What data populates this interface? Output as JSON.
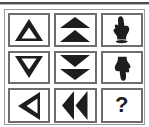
{
  "window": {
    "title": "Navigation Buttons Palette"
  },
  "separator": {
    "name": "top-divider"
  },
  "panel": {
    "name": "button-grid-panel",
    "columns": 3,
    "rows": 3
  },
  "buttons": [
    {
      "id": "step-up",
      "label": "Step Up",
      "icon": "hollow-triangle-up-icon",
      "aria": "Move up one step",
      "row": 1,
      "col": 1
    },
    {
      "id": "jump-up",
      "label": "Jump Up",
      "icon": "double-triangle-up-icon",
      "aria": "Move up quickly",
      "row": 1,
      "col": 2
    },
    {
      "id": "point-up",
      "label": "Point Up",
      "icon": "hand-pointing-up-icon",
      "aria": "Hand pointing up",
      "row": 1,
      "col": 3
    },
    {
      "id": "step-down",
      "label": "Step Down",
      "icon": "hollow-triangle-down-icon",
      "aria": "Move down one step",
      "row": 2,
      "col": 1
    },
    {
      "id": "jump-down",
      "label": "Jump Down",
      "icon": "double-triangle-down-icon",
      "aria": "Move down quickly",
      "row": 2,
      "col": 2
    },
    {
      "id": "point-down",
      "label": "Point Down",
      "icon": "hand-pointing-down-icon",
      "aria": "Hand pointing down",
      "row": 2,
      "col": 3
    },
    {
      "id": "step-left",
      "label": "Step Left",
      "icon": "hollow-triangle-left-icon",
      "aria": "Move left one step",
      "row": 3,
      "col": 1
    },
    {
      "id": "jump-left",
      "label": "Jump Left",
      "icon": "double-triangle-left-icon",
      "aria": "Move left quickly",
      "row": 3,
      "col": 2
    },
    {
      "id": "help",
      "label": "?",
      "icon": "question-mark-icon",
      "aria": "Help",
      "row": 3,
      "col": 3
    }
  ],
  "colors": {
    "page_background": "#ffffff",
    "button_background": "#ffffff",
    "button_border": "#6d6d6d",
    "panel_border": "#9a9a9a",
    "glyph": "#1d1d1d",
    "divider": "#4d4d4d"
  }
}
